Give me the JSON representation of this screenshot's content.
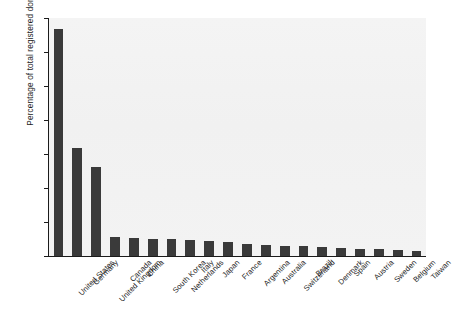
{
  "chart_data": {
    "type": "bar",
    "title": "",
    "xlabel": "",
    "ylabel": "Percentage of total registered domains",
    "ylim": [
      0,
      35
    ],
    "yticks": [
      0,
      5,
      10,
      15,
      20,
      25,
      30,
      35
    ],
    "grid": false,
    "legend": "none",
    "bar_color": "#3a3a3a",
    "plot_background": "#f2f2f2",
    "categories": [
      "United States",
      "Germany",
      "United Kingdom",
      "Canada",
      "China",
      "South Korea",
      "Netherlands",
      "Italy",
      "Japan",
      "France",
      "Argentina",
      "Australia",
      "Switzerland",
      "Brazil",
      "Denmark",
      "Spain",
      "Austria",
      "Sweden",
      "Belgium",
      "Taiwan"
    ],
    "values": [
      33.4,
      15.9,
      13.1,
      2.75,
      2.6,
      2.5,
      2.45,
      2.3,
      2.15,
      2.0,
      1.75,
      1.6,
      1.5,
      1.45,
      1.3,
      1.2,
      1.1,
      1.0,
      0.9,
      0.7
    ]
  }
}
